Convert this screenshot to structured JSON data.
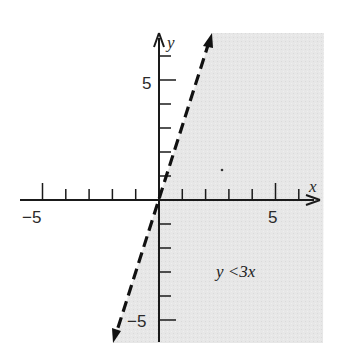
{
  "chart_data": {
    "type": "line",
    "title": "",
    "xlabel": "x",
    "ylabel": "y",
    "xlim": [
      -6,
      7
    ],
    "ylim": [
      -6,
      7
    ],
    "grid": false,
    "x_ticks": [
      -5,
      -4,
      -3,
      -2,
      -1,
      1,
      2,
      3,
      4,
      5,
      6
    ],
    "y_ticks": [
      -5,
      -4,
      -3,
      -2,
      -1,
      1,
      2,
      3,
      4,
      5,
      6
    ],
    "x_tick_labels": [
      {
        "value": -5,
        "text": "−5"
      },
      {
        "value": 5,
        "text": "5"
      }
    ],
    "y_tick_labels": [
      {
        "value": 5,
        "text": "5"
      },
      {
        "value": -5,
        "text": "−5"
      }
    ],
    "series": [
      {
        "name": "boundary y = 3x",
        "style": "dashed",
        "arrows": "both",
        "x": [
          -2.0,
          2.3
        ],
        "y": [
          -6.0,
          6.9
        ]
      }
    ],
    "shaded_region": {
      "inequality": "y < 3x",
      "side": "right of line",
      "color": "#e6e6e6"
    },
    "annotations": [
      {
        "text": "y <3x",
        "x": 2.5,
        "y": -3
      }
    ]
  },
  "labels": {
    "x_axis": "x",
    "y_axis": "y",
    "x_neg5": "−5",
    "x_pos5": "5",
    "y_pos5": "5",
    "y_neg5": "−5",
    "inequality": "y <3x"
  },
  "colors": {
    "shade": "#e6e6e6",
    "ink": "#1a1a1a",
    "background": "#ffffff"
  }
}
